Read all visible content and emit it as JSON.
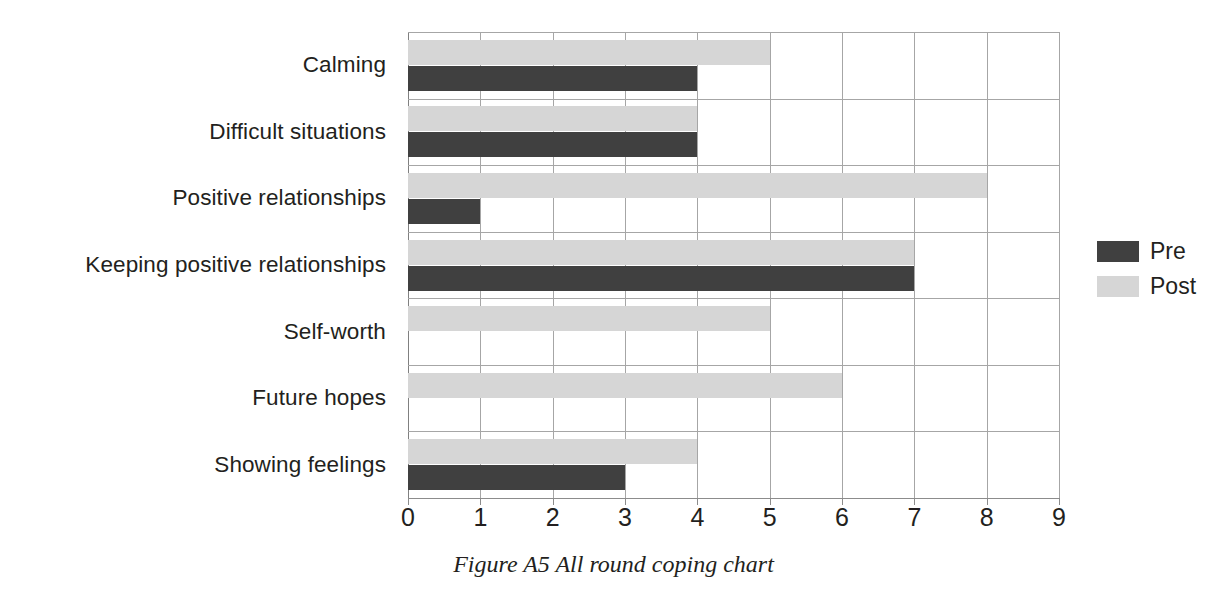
{
  "caption": "Figure A5 All round coping chart",
  "legend": {
    "position": "right",
    "entries": [
      {
        "label": "Pre",
        "color": "#404040",
        "swatch": "legend-swatch-pre"
      },
      {
        "label": "Post",
        "color": "#d6d6d6",
        "swatch": "legend-swatch-post"
      }
    ]
  },
  "chart_data": {
    "type": "bar",
    "orientation": "horizontal",
    "title": "",
    "xlabel": "",
    "ylabel": "",
    "xlim": [
      0,
      9
    ],
    "xticks": [
      0,
      1,
      2,
      3,
      4,
      5,
      6,
      7,
      8,
      9
    ],
    "xtick_labels": [
      "0",
      "1",
      "2",
      "3",
      "4",
      "5",
      "6",
      "7",
      "8",
      "9"
    ],
    "grid": true,
    "grid_axis": "both",
    "categories": [
      "Calming",
      "Difficult situations",
      "Positive relationships",
      "Keeping positive relationships",
      "Self-worth",
      "Future hopes",
      "Showing feelings"
    ],
    "series": [
      {
        "name": "Pre",
        "color": "#404040",
        "values": [
          4,
          4,
          1,
          7,
          0,
          0,
          3
        ]
      },
      {
        "name": "Post",
        "color": "#d6d6d6",
        "values": [
          5,
          4,
          8,
          7,
          5,
          6,
          4
        ]
      }
    ]
  }
}
